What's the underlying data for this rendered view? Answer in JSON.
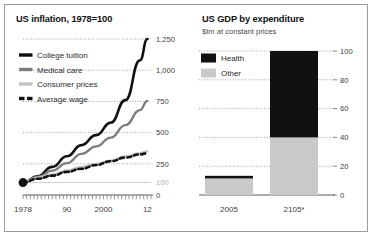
{
  "figure": {
    "border_color": "#9a9a9a",
    "background": "#ffffff"
  },
  "panels": [
    {
      "id": "us-inflation",
      "title": "US inflation, 1978=100",
      "subtitle": ""
    },
    {
      "id": "us-gdp",
      "title": "US GDP by expenditure",
      "subtitle": "$tm at constant prices"
    }
  ],
  "colors": {
    "college_tuition": "#111111",
    "medical_care": "#7d7d7d",
    "consumer_prices": "#c4c4c4",
    "average_wage": "#111111",
    "health": "#111111",
    "other": "#c9c9c9",
    "gridline": "#8c8c8c",
    "axis": "#5a5a5a",
    "baseline_label": "#b2b2b2"
  },
  "chart_data": [
    {
      "type": "line",
      "id": "us-inflation",
      "title": "US inflation, 1978=100",
      "xlabel": "",
      "ylabel": "",
      "xlim": [
        1978,
        2013
      ],
      "ylim": [
        0,
        1250
      ],
      "grid": true,
      "grid_style": "dotted-horizontal",
      "legend_position": "top-left",
      "yticks": [
        0,
        100,
        250,
        500,
        750,
        1000,
        1250
      ],
      "ytick_labels": [
        "0",
        "100",
        "250",
        "500",
        "750",
        "1,000",
        "1,250"
      ],
      "ytick_label_faint": [
        "100"
      ],
      "xticks": [
        1978,
        1990,
        2000,
        2012
      ],
      "xtick_labels": [
        "1978",
        "90",
        "2000",
        "12"
      ],
      "x_minor_ticks": true,
      "origin_marker": {
        "x": 1978,
        "y": 100,
        "shape": "circle",
        "color": "#111111"
      },
      "x": [
        1978,
        1982,
        1986,
        1990,
        1994,
        1998,
        2002,
        2006,
        2010,
        2012
      ],
      "series": [
        {
          "name": "College tuition",
          "color": "#111111",
          "style": "solid",
          "width": 2.6,
          "values": [
            100,
            150,
            225,
            310,
            400,
            480,
            580,
            760,
            1080,
            1250
          ]
        },
        {
          "name": "Medical care",
          "color": "#7d7d7d",
          "style": "solid",
          "width": 2.3,
          "values": [
            100,
            145,
            195,
            255,
            330,
            390,
            460,
            560,
            680,
            755
          ]
        },
        {
          "name": "Consumer prices",
          "color": "#c4c4c4",
          "style": "solid",
          "width": 2.3,
          "values": [
            100,
            140,
            165,
            195,
            225,
            250,
            275,
            310,
            335,
            350
          ]
        },
        {
          "name": "Average wage",
          "color": "#111111",
          "style": "dashed",
          "width": 2.6,
          "values": [
            100,
            130,
            155,
            185,
            210,
            240,
            270,
            300,
            325,
            335
          ]
        }
      ]
    },
    {
      "type": "bar",
      "id": "us-gdp",
      "title": "US GDP by expenditure",
      "subtitle": "$tm at constant prices",
      "xlabel": "",
      "ylabel": "",
      "ylim": [
        0,
        100
      ],
      "grid": true,
      "grid_style": "dotted-horizontal",
      "legend_position": "top-left",
      "stacked": true,
      "yticks": [
        0,
        20,
        40,
        60,
        80,
        100
      ],
      "ytick_labels": [
        "0",
        "20",
        "40",
        "60",
        "80",
        "100"
      ],
      "categories": [
        "2005",
        "2105*"
      ],
      "series": [
        {
          "name": "Other",
          "color": "#c9c9c9",
          "values": [
            11.5,
            40
          ]
        },
        {
          "name": "Health",
          "color": "#111111",
          "values": [
            1.8,
            60
          ]
        }
      ]
    }
  ]
}
